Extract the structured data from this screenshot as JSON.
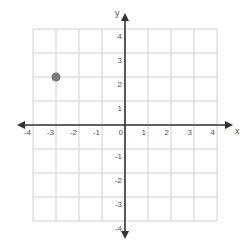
{
  "chart_data": {
    "type": "scatter",
    "title": "",
    "xlabel": "x",
    "ylabel": "y",
    "xlim": [
      -4,
      4
    ],
    "ylim": [
      -4,
      4
    ],
    "grid": true,
    "x_ticks": [
      -4,
      -3,
      -2,
      -1,
      0,
      1,
      2,
      3,
      4
    ],
    "y_ticks": [
      4,
      3,
      2,
      1,
      -1,
      -2,
      -3,
      -4
    ],
    "series": [
      {
        "name": "point",
        "points": [
          {
            "x": -3,
            "y": 2
          }
        ],
        "color": "#7a7a7a"
      }
    ]
  },
  "colors": {
    "grid": "#d0d0d0",
    "axis": "#333333",
    "point": "#7a7a7a",
    "label": "#555555"
  }
}
